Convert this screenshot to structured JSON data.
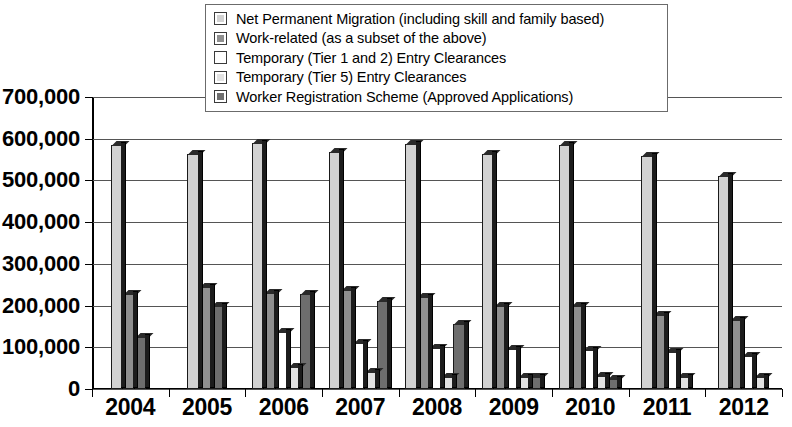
{
  "chart_data": {
    "type": "bar",
    "title": "",
    "subtitle": "",
    "xlabel": "",
    "ylabel": "",
    "categories": [
      "2004",
      "2005",
      "2006",
      "2007",
      "2008",
      "2009",
      "2010",
      "2011",
      "2012"
    ],
    "ylim": [
      0,
      700000
    ],
    "ytick_labels": [
      "0",
      "100,000",
      "200,000",
      "300,000",
      "400,000",
      "500,000",
      "600,000",
      "700,000"
    ],
    "ytick_values": [
      0,
      100000,
      200000,
      300000,
      400000,
      500000,
      600000,
      700000
    ],
    "grid": true,
    "legend_position": "top-center",
    "series": [
      {
        "name": "Net Permanent Migration (including skill and family based)",
        "color": "#d2d2d2",
        "values": [
          585000,
          563000,
          590000,
          568000,
          588000,
          563000,
          586000,
          558000,
          510000
        ]
      },
      {
        "name": "Work-related (as a subset of the above)",
        "color": "#8f8f8f",
        "values": [
          227000,
          245000,
          230000,
          238000,
          220000,
          198000,
          198000,
          178000,
          165000
        ]
      },
      {
        "name": "Temporary (Tier 1 and 2)  Entry Clearances",
        "color": "#ffffff",
        "values": [
          null,
          null,
          137000,
          110000,
          98000,
          95000,
          93000,
          88000,
          80000
        ]
      },
      {
        "name": "Temporary (Tier 5)  Entry Clearances",
        "color": "#e2e2e2",
        "values": [
          null,
          null,
          52000,
          40000,
          30000,
          30000,
          32000,
          28000,
          30000
        ]
      },
      {
        "name": "Worker Registration Scheme (Approved Applications)",
        "color": "#6e6e6e",
        "values": [
          125000,
          200000,
          227000,
          210000,
          155000,
          28000,
          25000,
          null,
          null
        ]
      }
    ]
  },
  "legend": {
    "items": [
      {
        "label": "Net Permanent Migration (including skill and family based)",
        "color": "#d2d2d2"
      },
      {
        "label": "Work-related (as a subset of the above)",
        "color": "#8f8f8f"
      },
      {
        "label": "Temporary (Tier 1 and 2)  Entry Clearances",
        "color": "#ffffff"
      },
      {
        "label": "Temporary (Tier 5)  Entry Clearances",
        "color": "#e2e2e2"
      },
      {
        "label": "Worker Registration Scheme (Approved Applications)",
        "color": "#6e6e6e"
      }
    ]
  }
}
